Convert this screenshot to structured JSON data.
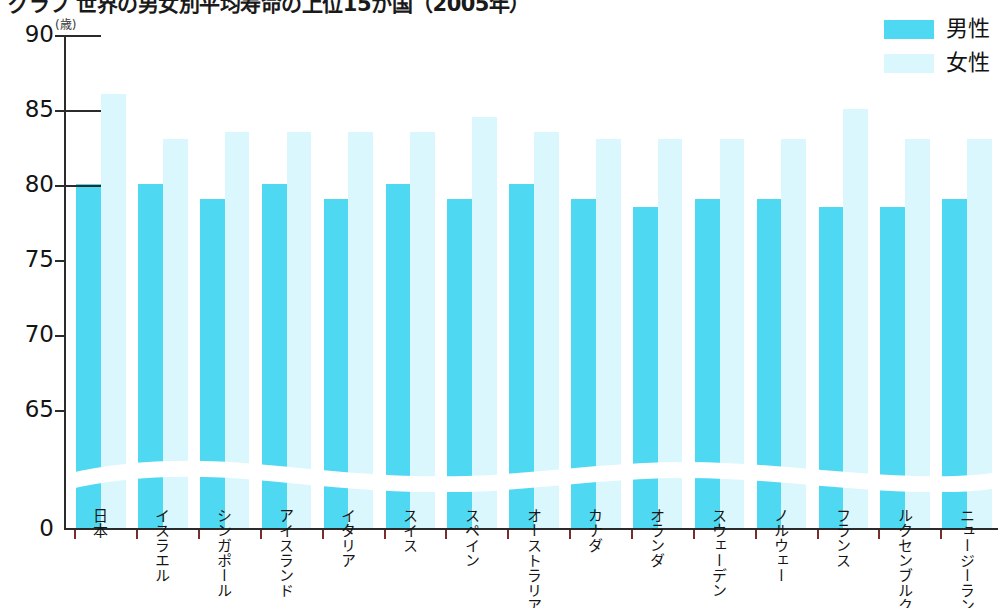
{
  "title": "グラフ 世界の男女別平均寿命の上位15か国（2005年）",
  "unit_caption": "(歳)",
  "legend": {
    "position": "top-right",
    "entries": [
      {
        "label": "男性",
        "color": "#4fd8f2"
      },
      {
        "label": "女性",
        "color": "#d9f7fc"
      }
    ]
  },
  "axis": {
    "y_ticks": [
      "0",
      "65",
      "70",
      "75",
      "80",
      "85",
      "90"
    ],
    "y_break": true
  },
  "chart_data": {
    "type": "bar",
    "title": "グラフ 世界の男女別平均寿命の上位15か国（2005年）",
    "xlabel": "",
    "ylabel": "(歳)",
    "ylim": [
      0,
      90
    ],
    "yticks": [
      0,
      65,
      70,
      75,
      80,
      85,
      90
    ],
    "grid": false,
    "axis_break": "0-65",
    "legend_position": "top-right",
    "categories": [
      "日本",
      "イスラエル",
      "シンガポール",
      "アイスランド",
      "イタリア",
      "スイス",
      "スペイン",
      "オーストラリア",
      "カナダ",
      "オランダ",
      "スウェーデン",
      "ノルウェー",
      "フランス",
      "ルクセンブルク",
      "ニュージーランド"
    ],
    "series": [
      {
        "name": "男性",
        "color": "#4fd8f2",
        "values": [
          80.0,
          80.0,
          79.0,
          80.0,
          79.0,
          80.0,
          79.0,
          80.0,
          79.0,
          78.5,
          79.0,
          79.0,
          78.5,
          78.5,
          79.0
        ]
      },
      {
        "name": "女性",
        "color": "#d9f7fc",
        "values": [
          86.0,
          83.0,
          83.5,
          83.5,
          83.5,
          83.5,
          84.5,
          83.5,
          83.0,
          83.0,
          83.0,
          83.0,
          85.0,
          83.0,
          83.0
        ]
      }
    ]
  }
}
